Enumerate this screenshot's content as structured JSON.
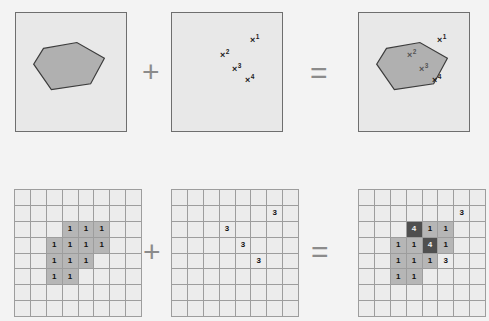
{
  "figure": {
    "background_color": "#f3f3f3",
    "panel_fill": "#e8e8e8",
    "panel_border": "#6e6e6e",
    "polygon_fill": "#b0b0b0",
    "polygon_stroke": "#3c3c3c",
    "grid_fill": "#ececec",
    "grid_line": "#9d9d9d",
    "cell_mid": "#b6b6b6",
    "cell_dark": "#4f4f4f"
  },
  "operators": {
    "plus": "+",
    "equals": "="
  },
  "top_row": {
    "polygon_panel": {
      "label": "polygon-region",
      "polygon_points": "28,36 62,30 90,46 76,72 36,78 18,52"
    },
    "points_panel": {
      "label": "feature-points",
      "points": [
        {
          "id": "1",
          "mark": "×",
          "sup": "1",
          "left": 78,
          "top": 21
        },
        {
          "id": "2",
          "mark": "×",
          "sup": "2",
          "left": 48,
          "top": 36
        },
        {
          "id": "3",
          "mark": "×",
          "sup": "3",
          "left": 60,
          "top": 50
        },
        {
          "id": "4",
          "mark": "×",
          "sup": "4",
          "left": 73,
          "top": 61
        }
      ]
    },
    "overlay_panel": {
      "label": "polygon-with-points",
      "polygon_points": "28,36 62,30 90,46 76,72 36,78 18,52",
      "points": [
        {
          "id": "1",
          "mark": "×",
          "sup": "1",
          "left": 78,
          "top": 21,
          "inside": false
        },
        {
          "id": "2",
          "mark": "×",
          "sup": "2",
          "left": 48,
          "top": 36,
          "inside": true
        },
        {
          "id": "3",
          "mark": "×",
          "sup": "3",
          "left": 60,
          "top": 50,
          "inside": true
        },
        {
          "id": "4",
          "mark": "×",
          "sup": "4",
          "left": 73,
          "top": 61,
          "inside": false
        }
      ]
    }
  },
  "bottom_row": {
    "shape_grid": {
      "label": "rasterized-shape-grid",
      "rows": 8,
      "cols": 8,
      "cells": [
        [
          "",
          "",
          "",
          "",
          "",
          "",
          "",
          ""
        ],
        [
          "",
          "",
          "",
          "",
          "",
          "",
          "",
          ""
        ],
        [
          "",
          "",
          "",
          "1",
          "1",
          "1",
          "",
          ""
        ],
        [
          "",
          "",
          "1",
          "1",
          "1",
          "1",
          "",
          ""
        ],
        [
          "",
          "",
          "1",
          "1",
          "1",
          "",
          "",
          ""
        ],
        [
          "",
          "",
          "1",
          "1",
          "",
          "",
          "",
          ""
        ],
        [
          "",
          "",
          "",
          "",
          "",
          "",
          "",
          ""
        ],
        [
          "",
          "",
          "",
          "",
          "",
          "",
          "",
          ""
        ]
      ],
      "shading": [
        [
          "l",
          "l",
          "l",
          "l",
          "l",
          "l",
          "l",
          "l"
        ],
        [
          "l",
          "l",
          "l",
          "l",
          "l",
          "l",
          "l",
          "l"
        ],
        [
          "l",
          "l",
          "l",
          "m",
          "m",
          "m",
          "l",
          "l"
        ],
        [
          "l",
          "l",
          "m",
          "m",
          "m",
          "m",
          "l",
          "l"
        ],
        [
          "l",
          "l",
          "m",
          "m",
          "m",
          "l",
          "l",
          "l"
        ],
        [
          "l",
          "l",
          "m",
          "m",
          "l",
          "l",
          "l",
          "l"
        ],
        [
          "l",
          "l",
          "l",
          "l",
          "l",
          "l",
          "l",
          "l"
        ],
        [
          "l",
          "l",
          "l",
          "l",
          "l",
          "l",
          "l",
          "l"
        ]
      ]
    },
    "points_grid": {
      "label": "rasterized-points-grid",
      "rows": 8,
      "cols": 8,
      "cells": [
        [
          "",
          "",
          "",
          "",
          "",
          "",
          "",
          ""
        ],
        [
          "",
          "",
          "",
          "",
          "",
          "",
          "3",
          ""
        ],
        [
          "",
          "",
          "",
          "3",
          "",
          "",
          "",
          ""
        ],
        [
          "",
          "",
          "",
          "",
          "3",
          "",
          "",
          ""
        ],
        [
          "",
          "",
          "",
          "",
          "",
          "3",
          "",
          ""
        ],
        [
          "",
          "",
          "",
          "",
          "",
          "",
          "",
          ""
        ],
        [
          "",
          "",
          "",
          "",
          "",
          "",
          "",
          ""
        ],
        [
          "",
          "",
          "",
          "",
          "",
          "",
          "",
          ""
        ]
      ],
      "shading": [
        [
          "l",
          "l",
          "l",
          "l",
          "l",
          "l",
          "l",
          "l"
        ],
        [
          "l",
          "l",
          "l",
          "l",
          "l",
          "l",
          "l",
          "l"
        ],
        [
          "l",
          "l",
          "l",
          "l",
          "l",
          "l",
          "l",
          "l"
        ],
        [
          "l",
          "l",
          "l",
          "l",
          "l",
          "l",
          "l",
          "l"
        ],
        [
          "l",
          "l",
          "l",
          "l",
          "l",
          "l",
          "l",
          "l"
        ],
        [
          "l",
          "l",
          "l",
          "l",
          "l",
          "l",
          "l",
          "l"
        ],
        [
          "l",
          "l",
          "l",
          "l",
          "l",
          "l",
          "l",
          "l"
        ],
        [
          "l",
          "l",
          "l",
          "l",
          "l",
          "l",
          "l",
          "l"
        ]
      ]
    },
    "sum_grid": {
      "label": "combined-sum-grid",
      "rows": 8,
      "cols": 8,
      "cells": [
        [
          "",
          "",
          "",
          "",
          "",
          "",
          "",
          ""
        ],
        [
          "",
          "",
          "",
          "",
          "",
          "",
          "3",
          ""
        ],
        [
          "",
          "",
          "",
          "4",
          "1",
          "1",
          "",
          ""
        ],
        [
          "",
          "",
          "1",
          "1",
          "4",
          "1",
          "",
          ""
        ],
        [
          "",
          "",
          "1",
          "1",
          "1",
          "3",
          "",
          ""
        ],
        [
          "",
          "",
          "1",
          "1",
          "",
          "",
          "",
          ""
        ],
        [
          "",
          "",
          "",
          "",
          "",
          "",
          "",
          ""
        ],
        [
          "",
          "",
          "",
          "",
          "",
          "",
          "",
          ""
        ]
      ],
      "shading": [
        [
          "l",
          "l",
          "l",
          "l",
          "l",
          "l",
          "l",
          "l"
        ],
        [
          "l",
          "l",
          "l",
          "l",
          "l",
          "l",
          "l",
          "l"
        ],
        [
          "l",
          "l",
          "l",
          "d",
          "m",
          "m",
          "l",
          "l"
        ],
        [
          "l",
          "l",
          "m",
          "m",
          "d",
          "m",
          "l",
          "l"
        ],
        [
          "l",
          "l",
          "m",
          "m",
          "m",
          "l",
          "l",
          "l"
        ],
        [
          "l",
          "l",
          "m",
          "m",
          "l",
          "l",
          "l",
          "l"
        ],
        [
          "l",
          "l",
          "l",
          "l",
          "l",
          "l",
          "l",
          "l"
        ],
        [
          "l",
          "l",
          "l",
          "l",
          "l",
          "l",
          "l",
          "l"
        ]
      ]
    }
  }
}
